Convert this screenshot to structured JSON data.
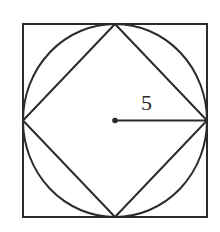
{
  "diagram": {
    "outer_square": {
      "x1": 23,
      "y1": 24,
      "x2": 207,
      "y2": 217
    },
    "circle": {
      "cx": 115,
      "cy": 120.5,
      "r": 92
    },
    "center_point": {
      "cx": 115,
      "cy": 120.5
    },
    "radius_label": "5",
    "stroke_color": "#2a2a2a",
    "background": "#ffffff"
  }
}
